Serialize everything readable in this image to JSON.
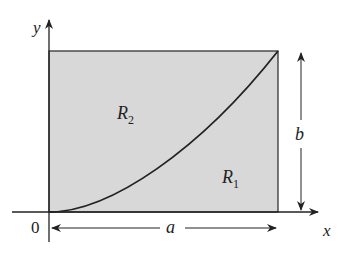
{
  "diagram": {
    "type": "region-area-figure",
    "axes": {
      "x_label": "x",
      "y_label": "y",
      "origin_label": "0"
    },
    "rectangle": {
      "width_label": "a",
      "height_label": "b",
      "fill": "#d8d8d8",
      "stroke": "#333333"
    },
    "curve": {
      "description": "increasing curve from origin to top-right corner (a, b)",
      "stroke": "#222222"
    },
    "regions": [
      {
        "name": "R",
        "subscript": "2",
        "position": "above curve"
      },
      {
        "name": "R",
        "subscript": "1",
        "position": "below curve"
      }
    ]
  }
}
